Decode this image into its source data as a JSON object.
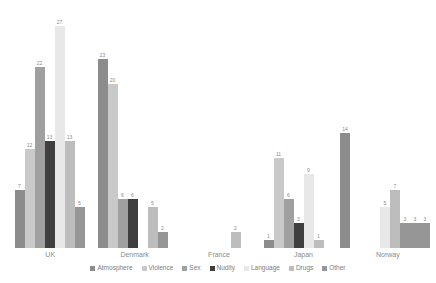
{
  "chart_data": {
    "type": "bar",
    "title": "",
    "subtitle": "",
    "xlabel": "",
    "ylabel": "",
    "grid": false,
    "legend_position": "bottom",
    "ylim": [
      0,
      27
    ],
    "categories": [
      "UK",
      "Denmark",
      "France",
      "Japan",
      "Norway"
    ],
    "series": [
      {
        "name": "Atmosphere",
        "color": "#8c8c8c",
        "values": [
          7,
          23,
          0,
          1,
          14
        ]
      },
      {
        "name": "Violence",
        "color": "#c9c9c9",
        "values": [
          12,
          20,
          0,
          11,
          0
        ]
      },
      {
        "name": "Sex",
        "color": "#a0a0a0",
        "values": [
          22,
          6,
          0,
          6,
          0
        ]
      },
      {
        "name": "Nudity",
        "color": "#3f3f3f",
        "values": [
          13,
          6,
          0,
          3,
          0
        ]
      },
      {
        "name": "Language",
        "color": "#e8e8e8",
        "values": [
          27,
          0,
          0,
          9,
          5
        ]
      },
      {
        "name": "Drugs",
        "color": "#bdbdbd",
        "values": [
          13,
          5,
          2,
          1,
          7
        ]
      },
      {
        "name": "Other",
        "color": "#969696",
        "values": [
          5,
          2,
          0,
          0,
          3
        ]
      }
    ],
    "bar_labels_shown": true,
    "zero_labels_hidden": true,
    "extra_bars": [
      {
        "category": "Norway",
        "series": "Other",
        "value": 3
      },
      {
        "category": "Norway",
        "series": "Other",
        "value": 3
      }
    ]
  },
  "legend": {
    "items": [
      {
        "label": "Atmosphere",
        "color": "#8c8c8c"
      },
      {
        "label": "Violence",
        "color": "#c9c9c9"
      },
      {
        "label": "Sex",
        "color": "#a0a0a0"
      },
      {
        "label": "Nudity",
        "color": "#3f3f3f"
      },
      {
        "label": "Language",
        "color": "#e8e8e8"
      },
      {
        "label": "Drugs",
        "color": "#bdbdbd"
      },
      {
        "label": "Other",
        "color": "#969696"
      }
    ]
  },
  "axis": {
    "categories": [
      "UK",
      "Denmark",
      "France",
      "Japan",
      "Norway"
    ]
  }
}
